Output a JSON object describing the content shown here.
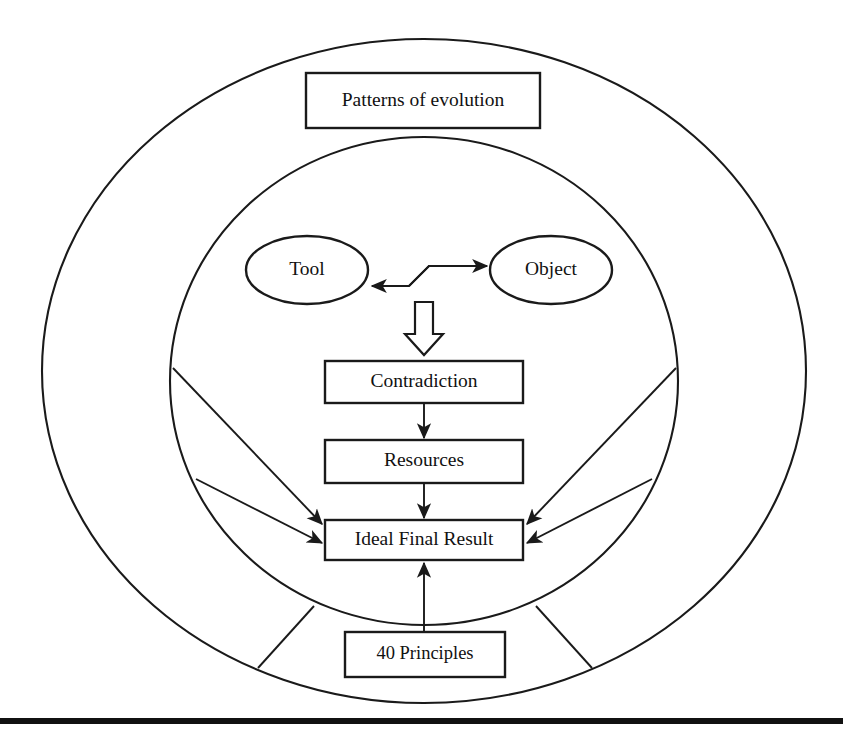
{
  "figure": {
    "background_color": "#ffffff",
    "line_color": "#1a1a1a",
    "baseline_bar_color": "#111111"
  },
  "rings": [
    {
      "name": "outer-ring",
      "label": "",
      "cx": 424,
      "cy": 371,
      "rx": 382,
      "ry": 332
    },
    {
      "name": "inner-ring",
      "label": "",
      "cx": 424,
      "cy": 381,
      "rx": 254,
      "ry": 244
    }
  ],
  "nodes": {
    "patterns": {
      "label": "Patterns of evolution",
      "shape": "rect",
      "x": 306,
      "y": 73,
      "w": 234,
      "h": 55
    },
    "tool": {
      "label": "Tool",
      "shape": "ellipse",
      "cx": 307,
      "cy": 270,
      "rx": 61,
      "ry": 34
    },
    "object": {
      "label": "Object",
      "shape": "ellipse",
      "cx": 551,
      "cy": 270,
      "rx": 61,
      "ry": 34
    },
    "contradiction": {
      "label": "Contradiction",
      "shape": "rect",
      "x": 325,
      "y": 361,
      "w": 198,
      "h": 42
    },
    "resources": {
      "label": "Resources",
      "shape": "rect",
      "x": 325,
      "y": 440,
      "w": 198,
      "h": 43
    },
    "ideal_final_result": {
      "label": "Ideal Final Result",
      "shape": "rect",
      "x": 325,
      "y": 520,
      "w": 198,
      "h": 40
    },
    "principles": {
      "label": "40 Principles",
      "shape": "rect",
      "x": 345,
      "y": 632,
      "w": 160,
      "h": 45
    }
  },
  "connectors": [
    {
      "name": "tool-to-object",
      "style": "z-double-arrow",
      "from": "tool",
      "to": "object"
    },
    {
      "name": "interaction-to-contradiction",
      "style": "hollow-block-arrow",
      "from": "interaction",
      "to": "contradiction"
    },
    {
      "name": "contradiction-to-resources",
      "style": "thin-arrow",
      "from": "contradiction",
      "to": "resources"
    },
    {
      "name": "resources-to-ifr",
      "style": "thin-arrow",
      "from": "resources",
      "to": "ideal_final_result"
    },
    {
      "name": "principles-to-ifr",
      "style": "thin-arrow",
      "from": "principles",
      "to": "ideal_final_result"
    },
    {
      "name": "ring-left-upper-to-ifr",
      "style": "thin-arrow",
      "from": "inner-ring",
      "to": "ideal_final_result"
    },
    {
      "name": "ring-left-lower-to-ifr",
      "style": "thin-arrow",
      "from": "inner-ring",
      "to": "ideal_final_result"
    },
    {
      "name": "ring-right-upper-to-ifr",
      "style": "thin-arrow",
      "from": "inner-ring",
      "to": "ideal_final_result"
    },
    {
      "name": "ring-right-lower-to-ifr",
      "style": "thin-arrow",
      "from": "inner-ring",
      "to": "ideal_final_result"
    },
    {
      "name": "spoke-bottom-left",
      "style": "plain-line",
      "from": "inner-ring",
      "to": "outer-ring"
    },
    {
      "name": "spoke-bottom-right",
      "style": "plain-line",
      "from": "inner-ring",
      "to": "outer-ring"
    }
  ],
  "baseline_bar": {
    "name": "baseline-bar",
    "x": 0,
    "y": 718,
    "w": 843,
    "h": 6
  }
}
